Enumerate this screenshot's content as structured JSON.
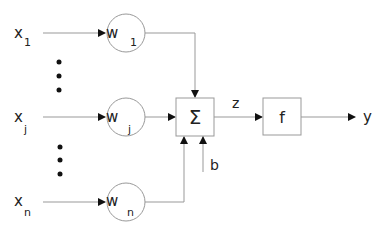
{
  "diagram": {
    "inputs": [
      {
        "name": "x",
        "sub": "1",
        "weight": "w",
        "wsub": "1"
      },
      {
        "name": "x",
        "sub": "j",
        "weight": "w",
        "wsub": "j"
      },
      {
        "name": "x",
        "sub": "n",
        "weight": "w",
        "wsub": "n"
      }
    ],
    "sum_symbol": "Σ",
    "bias_label": "b",
    "z_label": "z",
    "activation_label": "f",
    "output_label": "y",
    "colors": {
      "line": "#999999",
      "arrow": "#111111",
      "text": "#222222",
      "dots": "#111111"
    }
  }
}
